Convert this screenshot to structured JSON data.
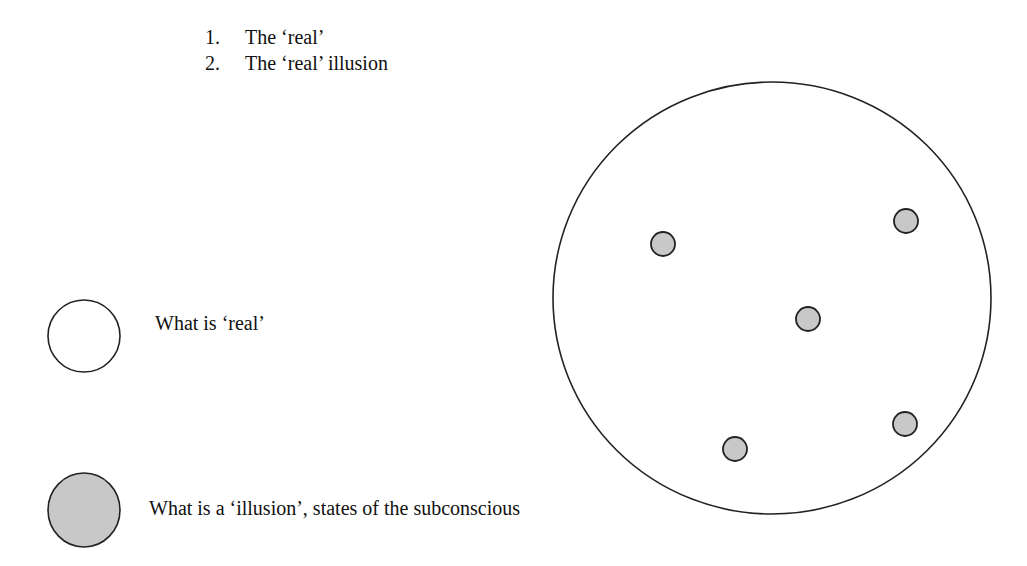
{
  "list": {
    "items": [
      {
        "number": "1.",
        "text": "The ‘real’"
      },
      {
        "number": "2.",
        "text": "The ‘real’ illusion"
      }
    ]
  },
  "legend": {
    "real": {
      "label": "What is ‘real’",
      "fill": "#ffffff"
    },
    "illusion": {
      "label": "What is a ‘illusion’, states of the subconscious",
      "fill": "#c8c8c8"
    }
  },
  "diagram": {
    "outer_circle": {
      "cx": 772,
      "cy": 298,
      "rx": 219,
      "ry": 216,
      "fill": "#ffffff"
    },
    "illusion_dots": [
      {
        "cx": 663,
        "cy": 244,
        "r": 12
      },
      {
        "cx": 906,
        "cy": 221,
        "r": 12
      },
      {
        "cx": 808,
        "cy": 319,
        "r": 12
      },
      {
        "cx": 735,
        "cy": 449,
        "r": 12
      },
      {
        "cx": 905,
        "cy": 424,
        "r": 12
      }
    ],
    "stroke": "#222222",
    "dot_fill": "#c8c8c8"
  }
}
